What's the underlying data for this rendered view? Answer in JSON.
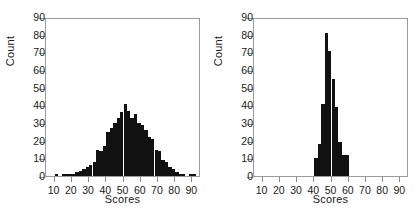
{
  "figure": {
    "background": "#ffffff",
    "ink_color": "#111111",
    "axis_color": "#9a9a9a"
  },
  "chart_data": [
    {
      "type": "bar",
      "title": "",
      "subtitle": "",
      "panel": "left",
      "xlabel": "Scores",
      "ylabel": "Count",
      "xlim": [
        5,
        95
      ],
      "ylim": [
        0,
        90
      ],
      "xticks": [
        10,
        20,
        30,
        40,
        50,
        60,
        70,
        80,
        90
      ],
      "xtick_labels": [
        "10",
        "20",
        "30",
        "40",
        "50",
        "60",
        "70",
        "80",
        "90"
      ],
      "yticks": [
        0,
        10,
        20,
        30,
        40,
        50,
        60,
        70,
        80,
        90
      ],
      "ytick_labels": [
        "0",
        "10",
        "20",
        "30",
        "40",
        "50",
        "60",
        "70",
        "80",
        "90"
      ],
      "grid": false,
      "legend": false,
      "bin_width": 2,
      "bin_starts": [
        8,
        10,
        12,
        14,
        16,
        18,
        20,
        22,
        24,
        26,
        28,
        30,
        32,
        34,
        36,
        38,
        40,
        42,
        44,
        46,
        48,
        50,
        52,
        54,
        56,
        58,
        60,
        62,
        64,
        66,
        68,
        70,
        72,
        74,
        76,
        78,
        80,
        82,
        84,
        86,
        88,
        90
      ],
      "values": [
        0,
        1,
        0,
        1,
        1,
        1,
        1,
        2,
        3,
        4,
        5,
        6,
        8,
        15,
        14,
        17,
        25,
        27,
        30,
        33,
        36,
        41,
        37,
        33,
        35,
        30,
        29,
        26,
        22,
        21,
        15,
        14,
        9,
        8,
        5,
        4,
        2,
        1,
        1,
        0,
        1,
        1
      ]
    },
    {
      "type": "bar",
      "title": "",
      "subtitle": "",
      "panel": "right",
      "xlabel": "Scores",
      "ylabel": "Count",
      "xlim": [
        5,
        95
      ],
      "ylim": [
        0,
        90
      ],
      "xticks": [
        10,
        20,
        30,
        40,
        50,
        60,
        70,
        80,
        90
      ],
      "xtick_labels": [
        "10",
        "20",
        "30",
        "40",
        "50",
        "60",
        "70",
        "80",
        "90"
      ],
      "yticks": [
        0,
        10,
        20,
        30,
        40,
        50,
        60,
        70,
        80,
        90
      ],
      "ytick_labels": [
        "0",
        "10",
        "20",
        "30",
        "40",
        "50",
        "60",
        "70",
        "80",
        "90"
      ],
      "grid": false,
      "legend": false,
      "bin_width": 2,
      "bin_starts": [
        40,
        42,
        44,
        46,
        48,
        50,
        52,
        54,
        56,
        58
      ],
      "values": [
        10,
        18,
        41,
        81,
        71,
        55,
        39,
        19,
        12,
        12
      ]
    }
  ]
}
